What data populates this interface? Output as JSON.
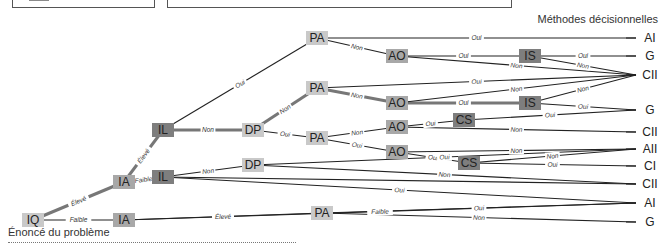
{
  "header": {
    "title_right": "Méthodes décisionnelles"
  },
  "caption": "Énoncé du problème",
  "colors": {
    "node_light": "#c9c9c9",
    "node_mid": "#a8a8a8",
    "node_dark": "#7e7e7e",
    "line": "#222222",
    "line_gray": "#777777"
  },
  "nodes": [
    {
      "id": "IQ",
      "label": "IQ",
      "x": 33,
      "y": 220,
      "shade": "light"
    },
    {
      "id": "IA1",
      "label": "IA",
      "x": 124,
      "y": 182,
      "shade": "mid"
    },
    {
      "id": "IA2",
      "label": "IA",
      "x": 124,
      "y": 220,
      "shade": "mid"
    },
    {
      "id": "IL1",
      "label": "IL",
      "x": 163,
      "y": 130,
      "shade": "dark"
    },
    {
      "id": "IL2",
      "label": "IL",
      "x": 163,
      "y": 177,
      "shade": "dark"
    },
    {
      "id": "DP1",
      "label": "DP",
      "x": 253,
      "y": 130,
      "shade": "light"
    },
    {
      "id": "DP2",
      "label": "DP",
      "x": 253,
      "y": 165,
      "shade": "light"
    },
    {
      "id": "PA1",
      "label": "PA",
      "x": 317,
      "y": 38,
      "shade": "light"
    },
    {
      "id": "PA2",
      "label": "PA",
      "x": 317,
      "y": 88,
      "shade": "light"
    },
    {
      "id": "PA3",
      "label": "PA",
      "x": 317,
      "y": 138,
      "shade": "light"
    },
    {
      "id": "PA4",
      "label": "PA",
      "x": 322,
      "y": 213,
      "shade": "light"
    },
    {
      "id": "AO1",
      "label": "AO",
      "x": 397,
      "y": 56,
      "shade": "mid"
    },
    {
      "id": "AO2",
      "label": "AO",
      "x": 397,
      "y": 103,
      "shade": "mid"
    },
    {
      "id": "AO3",
      "label": "AO",
      "x": 397,
      "y": 127,
      "shade": "mid"
    },
    {
      "id": "AO4",
      "label": "AO",
      "x": 397,
      "y": 152,
      "shade": "mid"
    },
    {
      "id": "IS1",
      "label": "IS",
      "x": 530,
      "y": 56,
      "shade": "dark"
    },
    {
      "id": "IS2",
      "label": "IS",
      "x": 530,
      "y": 103,
      "shade": "dark"
    },
    {
      "id": "CS1",
      "label": "CS",
      "x": 464,
      "y": 120,
      "shade": "dark"
    },
    {
      "id": "CS2",
      "label": "CS",
      "x": 469,
      "y": 163,
      "shade": "dark"
    }
  ],
  "outputs": [
    {
      "label": "AI",
      "y": 38
    },
    {
      "label": "G",
      "y": 56
    },
    {
      "label": "CII",
      "y": 75
    },
    {
      "label": "G",
      "y": 110
    },
    {
      "label": "CII",
      "y": 132
    },
    {
      "label": "AII",
      "y": 149
    },
    {
      "label": "CI",
      "y": 166
    },
    {
      "label": "CII",
      "y": 184
    },
    {
      "label": "AI",
      "y": 203
    },
    {
      "label": "G",
      "y": 222
    }
  ],
  "edges": [
    {
      "from": "IQ",
      "to": "IA1",
      "label": "Élevé",
      "heavy": true
    },
    {
      "from": "IQ",
      "to": "IA2",
      "label": "Faible",
      "heavy": false
    },
    {
      "from": "IA1",
      "to": "IL1",
      "label": "Élevé",
      "heavy": true
    },
    {
      "from": "IA1",
      "to": "IL2",
      "label": "Faible",
      "heavy": false
    },
    {
      "from": "IL1",
      "to": "PA1",
      "label": "Oui",
      "heavy": false
    },
    {
      "from": "IL1",
      "to": "DP1",
      "label": "Non",
      "heavy": true
    },
    {
      "from": "IL2",
      "to": "DP2",
      "label": "Non",
      "heavy": false
    },
    {
      "from": "DP1",
      "to": "PA2",
      "label": "Non",
      "heavy": true
    },
    {
      "from": "DP1",
      "to": "PA3",
      "label": "Oui",
      "heavy": false
    },
    {
      "from": "PA1",
      "to": "AO1",
      "label": "Non",
      "heavy": false
    },
    {
      "from": "PA2",
      "to": "AO2",
      "label": "Non",
      "heavy": true
    },
    {
      "from": "PA3",
      "to": "AO3",
      "label": "Non",
      "heavy": false
    },
    {
      "from": "PA3",
      "to": "AO4",
      "label": "Oui",
      "heavy": false
    },
    {
      "from": "AO1",
      "to": "IS1",
      "label": "Oui",
      "heavy": false
    },
    {
      "from": "AO2",
      "to": "IS2",
      "label": "Oui",
      "heavy": true
    },
    {
      "from": "AO3",
      "to": "CS1",
      "label": "Oui",
      "heavy": false
    },
    {
      "from": "AO4",
      "to": "CS2",
      "label": "Oui",
      "heavy": false
    },
    {
      "from": "IA2",
      "to": "PA4",
      "label": "Élevé",
      "heavy": false
    }
  ],
  "terminal_edges": [
    {
      "from": "PA1",
      "out": 0,
      "label": "Oui"
    },
    {
      "from": "AO1",
      "out": 2,
      "label": "Non"
    },
    {
      "from": "IS1",
      "out": 1,
      "label": "Oui"
    },
    {
      "from": "IS1",
      "out": 2,
      "label": "Non"
    },
    {
      "from": "PA2",
      "out": 2,
      "label": "Oui"
    },
    {
      "from": "AO2",
      "out": 2,
      "label": "Non"
    },
    {
      "from": "IS2",
      "out": 2,
      "label": "Non"
    },
    {
      "from": "IS2",
      "out": 3,
      "label": "Oui"
    },
    {
      "from": "CS1",
      "out": 3,
      "label": "Oui"
    },
    {
      "from": "AO3",
      "out": 4,
      "label": "Non"
    },
    {
      "from": "DP2",
      "out": 5,
      "label": "Oui"
    },
    {
      "from": "AO4",
      "out": 5,
      "label": "Non"
    },
    {
      "from": "CS2",
      "out": 5,
      "label": "Non"
    },
    {
      "from": "CS2",
      "out": 6,
      "label": "Oui"
    },
    {
      "from": "IL2",
      "out": 7,
      "label": ""
    },
    {
      "from": "DP2",
      "out": 7,
      "label": "Non"
    },
    {
      "from": "IL2",
      "out": 8,
      "label": "Oui"
    },
    {
      "from": "IA2",
      "out": 8,
      "label": "Faible"
    },
    {
      "from": "PA4",
      "out": 8,
      "label": "Oui"
    },
    {
      "from": "PA4",
      "out": 9,
      "label": "Non"
    }
  ]
}
